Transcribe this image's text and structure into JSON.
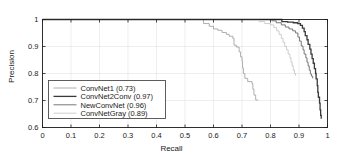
{
  "chart_data": {
    "type": "line",
    "title": "",
    "xlabel": "Recall",
    "ylabel": "Precision",
    "xlim": [
      0,
      1
    ],
    "ylim": [
      0.6,
      1.0
    ],
    "xticks": [
      "0",
      "0.1",
      "0.2",
      "0.3",
      "0.4",
      "0.5",
      "0.6",
      "0.7",
      "0.8",
      "0.9",
      "1"
    ],
    "xtick_values": [
      0,
      0.1,
      0.2,
      0.3,
      0.4,
      0.5,
      0.6,
      0.7,
      0.8,
      0.9,
      1.0
    ],
    "yticks": [
      "0.6",
      "0.7",
      "0.8",
      "0.9",
      "1"
    ],
    "ytick_values": [
      0.6,
      0.7,
      0.8,
      0.9,
      1.0
    ],
    "grid": true,
    "legend_position": "lower-left",
    "drawstyle": "steps-post",
    "series": [
      {
        "name": "ConvNet1 (0.73)",
        "label": "ConvNet1",
        "average_precision": 0.73,
        "color": "#9a9a9a",
        "width": 0.8,
        "points": [
          [
            0.0,
            1.0
          ],
          [
            0.5,
            1.0
          ],
          [
            0.545,
            1.0
          ],
          [
            0.565,
            0.985
          ],
          [
            0.585,
            0.975
          ],
          [
            0.6,
            0.965
          ],
          [
            0.615,
            0.96
          ],
          [
            0.63,
            0.952
          ],
          [
            0.645,
            0.945
          ],
          [
            0.655,
            0.938
          ],
          [
            0.668,
            0.93
          ],
          [
            0.672,
            0.905
          ],
          [
            0.68,
            0.898
          ],
          [
            0.69,
            0.88
          ],
          [
            0.695,
            0.862
          ],
          [
            0.7,
            0.845
          ],
          [
            0.702,
            0.82
          ],
          [
            0.705,
            0.8
          ],
          [
            0.71,
            0.782
          ],
          [
            0.72,
            0.77
          ],
          [
            0.735,
            0.762
          ],
          [
            0.738,
            0.742
          ],
          [
            0.742,
            0.72
          ],
          [
            0.748,
            0.702
          ],
          [
            0.755,
            0.7
          ]
        ]
      },
      {
        "name": "ConvNet2Conv (0.97)",
        "label": "ConvNet2Conv",
        "average_precision": 0.97,
        "color": "#3a3a3a",
        "width": 1.3,
        "points": [
          [
            0.0,
            1.0
          ],
          [
            0.78,
            1.0
          ],
          [
            0.82,
            1.0
          ],
          [
            0.84,
            0.992
          ],
          [
            0.86,
            0.99
          ],
          [
            0.88,
            0.988
          ],
          [
            0.895,
            0.985
          ],
          [
            0.905,
            0.978
          ],
          [
            0.912,
            0.968
          ],
          [
            0.918,
            0.955
          ],
          [
            0.922,
            0.94
          ],
          [
            0.928,
            0.925
          ],
          [
            0.932,
            0.908
          ],
          [
            0.938,
            0.89
          ],
          [
            0.942,
            0.872
          ],
          [
            0.946,
            0.855
          ],
          [
            0.95,
            0.838
          ],
          [
            0.954,
            0.818
          ],
          [
            0.958,
            0.8
          ],
          [
            0.96,
            0.78
          ],
          [
            0.964,
            0.755
          ],
          [
            0.966,
            0.73
          ],
          [
            0.968,
            0.712
          ],
          [
            0.972,
            0.69
          ],
          [
            0.974,
            0.665
          ],
          [
            0.976,
            0.645
          ],
          [
            0.978,
            0.632
          ]
        ]
      },
      {
        "name": "NewConvNet (0.96)",
        "label": "NewConvNet",
        "average_precision": 0.96,
        "color": "#6a6a6a",
        "width": 0.9,
        "points": [
          [
            0.0,
            1.0
          ],
          [
            0.76,
            1.0
          ],
          [
            0.79,
            1.0
          ],
          [
            0.805,
            0.995
          ],
          [
            0.82,
            0.988
          ],
          [
            0.838,
            0.98
          ],
          [
            0.852,
            0.972
          ],
          [
            0.865,
            0.965
          ],
          [
            0.878,
            0.958
          ],
          [
            0.888,
            0.95
          ],
          [
            0.896,
            0.935
          ],
          [
            0.902,
            0.92
          ],
          [
            0.908,
            0.902
          ],
          [
            0.914,
            0.888
          ],
          [
            0.918,
            0.872
          ],
          [
            0.924,
            0.858
          ],
          [
            0.928,
            0.842
          ],
          [
            0.932,
            0.828
          ],
          [
            0.936,
            0.812
          ],
          [
            0.94,
            0.798
          ],
          [
            0.944,
            0.79
          ],
          [
            0.948,
            0.782
          ]
        ]
      },
      {
        "name": "ConvNetGray (0.89)",
        "label": "ConvNetGray",
        "average_precision": 0.89,
        "color": "#c2c2c2",
        "width": 0.8,
        "points": [
          [
            0.0,
            1.0
          ],
          [
            0.7,
            1.0
          ],
          [
            0.74,
            1.0
          ],
          [
            0.76,
            0.992
          ],
          [
            0.78,
            0.985
          ],
          [
            0.8,
            0.98
          ],
          [
            0.812,
            0.97
          ],
          [
            0.822,
            0.958
          ],
          [
            0.83,
            0.945
          ],
          [
            0.838,
            0.93
          ],
          [
            0.844,
            0.915
          ],
          [
            0.85,
            0.9
          ],
          [
            0.856,
            0.888
          ],
          [
            0.862,
            0.872
          ],
          [
            0.868,
            0.858
          ],
          [
            0.872,
            0.842
          ],
          [
            0.876,
            0.828
          ],
          [
            0.88,
            0.812
          ],
          [
            0.884,
            0.8
          ],
          [
            0.888,
            0.792
          ]
        ]
      }
    ]
  },
  "legend": {
    "entries": [
      "ConvNet1 (0.73)",
      "ConvNet2Conv (0.97)",
      "NewConvNet (0.96)",
      "ConvNetGray (0.89)"
    ]
  },
  "colors": {
    "axis": "#1a1a1a",
    "grid": "#e2e2e2",
    "background": "#ffffff",
    "legend_border": "#4d4d4d"
  }
}
